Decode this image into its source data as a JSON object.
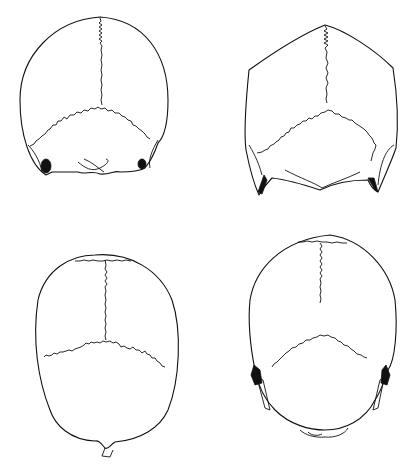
{
  "figure": {
    "background": "#ffffff",
    "line_color": "#111111",
    "panels": [
      {
        "id": "top-left",
        "description": "posterior view of skull, rounded vault with lambdoid suture"
      },
      {
        "id": "top-right",
        "description": "posterior view of skull, pentagonal/house-shaped vault"
      },
      {
        "id": "bottom-left",
        "description": "superior/posterior view of skull, oval vault with transverse suture"
      },
      {
        "id": "bottom-right",
        "description": "posterior view of skull, ovoid vault with mastoid processes"
      }
    ]
  }
}
